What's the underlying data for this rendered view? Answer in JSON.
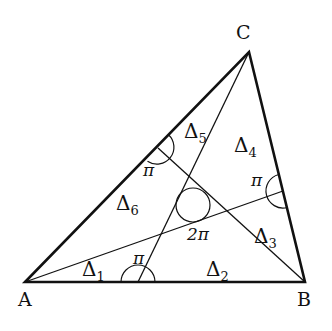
{
  "diagram": {
    "vertices": {
      "A": {
        "label": "A",
        "x": 25,
        "y": 282
      },
      "B": {
        "label": "B",
        "x": 305,
        "y": 282
      },
      "C": {
        "label": "C",
        "x": 249,
        "y": 52
      }
    },
    "interior_point": {
      "x": 193,
      "y": 205,
      "angle_label": "2π"
    },
    "side_points": {
      "on_AB": {
        "x": 138,
        "y": 282,
        "angle_label": "π"
      },
      "on_BC": {
        "x": 283,
        "y": 191,
        "angle_label": "π"
      },
      "on_CA": {
        "x": 158,
        "y": 148,
        "angle_label": "π"
      }
    },
    "regions": [
      {
        "symbol": "Δ",
        "sub": "1"
      },
      {
        "symbol": "Δ",
        "sub": "2"
      },
      {
        "symbol": "Δ",
        "sub": "3"
      },
      {
        "symbol": "Δ",
        "sub": "4"
      },
      {
        "symbol": "Δ",
        "sub": "5"
      },
      {
        "symbol": "Δ",
        "sub": "6"
      }
    ],
    "colors": {
      "stroke": "#111111",
      "background": "#ffffff"
    }
  }
}
